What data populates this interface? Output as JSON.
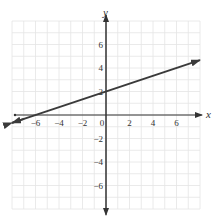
{
  "chart_data": {
    "type": "line",
    "title": "",
    "xlabel": "x",
    "ylabel": "y",
    "xlim": [
      -8,
      8
    ],
    "ylim": [
      -8,
      8
    ],
    "grid": true,
    "x_ticks": [
      -6,
      -4,
      -2,
      0,
      2,
      4,
      6
    ],
    "y_ticks": [
      -6,
      -4,
      -2,
      2,
      4,
      6
    ],
    "x_tick_labels": [
      "−6",
      "−4",
      "−2",
      "0",
      "2",
      "4",
      "6"
    ],
    "y_tick_labels": [
      "−6",
      "−4",
      "−2",
      "2",
      "4",
      "6"
    ],
    "series": [
      {
        "name": "line",
        "slope": 0.3333,
        "intercept": 2,
        "x": [
          -8,
          0,
          8
        ],
        "y": [
          -0.67,
          2,
          4.67
        ],
        "arrows_both_ends": true,
        "color": "#3a3a3a"
      }
    ]
  },
  "colors": {
    "grid": "#e4e4e4",
    "axis": "#333333",
    "line": "#3a3a3a"
  }
}
